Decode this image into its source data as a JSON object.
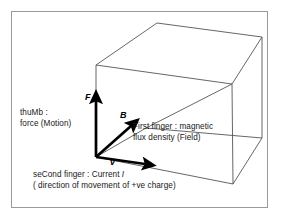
{
  "figure": {
    "name": "flemings-left-hand-rule",
    "frame_border_color": "#9a9a9a",
    "background_color": "#ffffff",
    "box_line_color": "#555555",
    "vector_color": "#000000",
    "text_color": "#181818"
  },
  "vectors": {
    "force": {
      "symbol": "F",
      "label_line1": "thuMb :",
      "label_line2": "force (Motion)"
    },
    "field": {
      "symbol": "B",
      "label_line1": "First finger : magnetic",
      "label_line2": "flux density (Field)"
    },
    "current": {
      "symbol": "v",
      "label_line1_prefix": "seCond finger : Current ",
      "label_line1_symbol": "I",
      "label_line2": "( direction of  movement of  +ve charge)"
    }
  }
}
